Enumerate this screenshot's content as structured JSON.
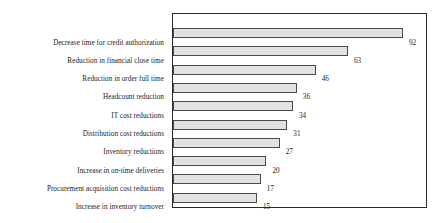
{
  "chart_data": {
    "type": "bar",
    "orientation": "horizontal",
    "title": "",
    "subtitle": "",
    "xlabel": "",
    "ylabel": "",
    "grid": false,
    "legend": null,
    "legend_position": "none",
    "xlim": [
      0,
      100
    ],
    "value_labels_shown": true,
    "categories": [
      "Decrease time for credit authorization",
      "Reduction in financial close time",
      "Reduction in order full time",
      "Headcount reduction",
      "IT cost reductions",
      "Distribution cost reductions",
      "Inventory reductions",
      "Increase in on-time deliveries",
      "Procurement acquisition cost reductions",
      "Increase in inventory turnover"
    ],
    "values": [
      92,
      63,
      46,
      36,
      34,
      31,
      27,
      20,
      17,
      15
    ],
    "value_strings": [
      "92",
      "63",
      "46",
      "36",
      "34",
      "31",
      "27",
      "20",
      "17",
      "15"
    ],
    "colors": {
      "bar_fill": "#e2e2e2",
      "bar_border": "#4a4a4a",
      "frame": "#2b2b2b",
      "text": "#1a1a1a",
      "background": "#ffffff"
    }
  }
}
